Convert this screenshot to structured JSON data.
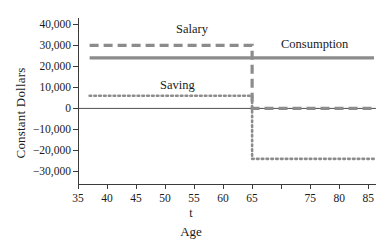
{
  "chart_data": {
    "type": "line",
    "title": "",
    "subtitle": "",
    "xlabel": "Age",
    "x_variable_label": "t",
    "ylabel": "Constant Dollars",
    "xlim": [
      35,
      86
    ],
    "ylim": [
      -35000,
      43000
    ],
    "xticks": [
      35,
      40,
      45,
      50,
      55,
      60,
      65,
      70,
      75,
      80,
      85
    ],
    "xticklabels": [
      "35",
      "40",
      "45",
      "50",
      "55",
      "60",
      "65",
      "",
      "75",
      "80",
      "85"
    ],
    "yticks": [
      40000,
      30000,
      20000,
      10000,
      0,
      -10000,
      -20000,
      -30000
    ],
    "yticklabels": [
      "40,000",
      "30,000",
      "20,000",
      "10,000",
      "0",
      "−10,000",
      "−20,000",
      "−30,000"
    ],
    "grid": false,
    "legend_position": "inline-annotations",
    "zero_line": 0,
    "retirement_age": 65,
    "series": [
      {
        "name": "Salary",
        "style": "dashed",
        "color": "#8c8c8c",
        "annotation": "Salary",
        "x": [
          37,
          65,
          65,
          86
        ],
        "values": [
          30000,
          30000,
          0,
          0
        ]
      },
      {
        "name": "Consumption",
        "style": "solid",
        "color": "#8c8c8c",
        "annotation": "Consumption",
        "x": [
          37,
          86
        ],
        "values": [
          24000,
          24000
        ]
      },
      {
        "name": "Saving",
        "style": "dotted",
        "color": "#8c8c8c",
        "annotation": "Saving",
        "x": [
          37,
          65,
          65,
          86
        ],
        "values": [
          6000,
          6000,
          -24000,
          -24000
        ]
      }
    ],
    "colors": {
      "axis": "#3b3b3b",
      "series_gray": "#8c8c8c",
      "text": "#1a1a1a",
      "background": "#ffffff"
    }
  }
}
